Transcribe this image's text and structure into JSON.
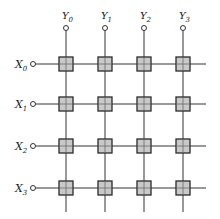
{
  "diagram": {
    "title": "",
    "type": "crossbar-switch",
    "colors": {
      "line": "#333333",
      "box_fill": "#c9c9c9",
      "box_stroke": "#2a2a2a",
      "terminal_fill": "#ffffff"
    },
    "columns": [
      {
        "label": "Y",
        "sub": "0",
        "x": 66
      },
      {
        "label": "Y",
        "sub": "1",
        "x": 105
      },
      {
        "label": "Y",
        "sub": "2",
        "x": 144
      },
      {
        "label": "Y",
        "sub": "3",
        "x": 183
      }
    ],
    "rows": [
      {
        "label": "X",
        "sub": "0",
        "y": 64
      },
      {
        "label": "X",
        "sub": "1",
        "y": 104
      },
      {
        "label": "X",
        "sub": "2",
        "y": 146
      },
      {
        "label": "X",
        "sub": "3",
        "y": 188
      }
    ],
    "crosspoint_count": 16
  }
}
